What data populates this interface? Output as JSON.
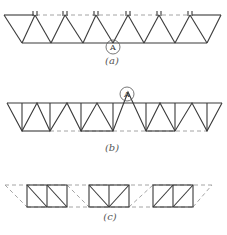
{
  "figure": {
    "panels": [
      {
        "id": "a",
        "caption": "(a)",
        "marker": "A",
        "description": "Inverted triangular truss with dashed top line and hinge marks"
      },
      {
        "id": "b",
        "caption": "(b)",
        "marker": "A",
        "description": "Warren truss with verticals, dashed bottom line"
      },
      {
        "id": "c",
        "caption": "(c)",
        "description": "Three separated rectangular truss segments with diagonals and dashed outline"
      }
    ],
    "colors": {
      "line": "#3a3a3a",
      "dash": "#9a9a9a"
    }
  }
}
